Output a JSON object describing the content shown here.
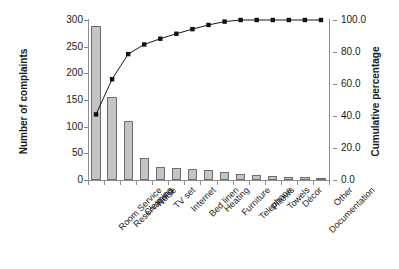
{
  "chart_data": {
    "type": "bar",
    "title": "",
    "subtitle": "",
    "xlabel": "",
    "ylabel": "Number of complaints",
    "y2label": "Cumulative percentage",
    "ylim": [
      0,
      300
    ],
    "y2lim": [
      0,
      100
    ],
    "grid": false,
    "legend": "none",
    "categories": [
      "Room Service",
      "Reservations",
      "Cleaning",
      "Noise",
      "TV set",
      "Internet",
      "Bed linen",
      "Heating",
      "Furniture",
      "Telephone",
      "Pillows",
      "Towels",
      "Décor",
      "Documentation",
      "Other"
    ],
    "series": [
      {
        "name": "Number of complaints",
        "type": "bar",
        "axis": "left",
        "values": [
          288,
          155,
          110,
          42,
          25,
          22,
          20,
          18,
          15,
          12,
          10,
          8,
          6,
          5,
          4
        ]
      },
      {
        "name": "Cumulative percentage",
        "type": "line",
        "axis": "right",
        "values": [
          41.0,
          63.0,
          78.7,
          84.7,
          88.3,
          91.4,
          94.3,
          96.9,
          99.0,
          100.0,
          100.0,
          100.0,
          100.0,
          100.0,
          100.0
        ]
      }
    ],
    "y_ticks": [
      0,
      50,
      100,
      150,
      200,
      250,
      300
    ],
    "y2_ticks": [
      "0.0",
      "20.0",
      "40.0",
      "60.0",
      "80.0",
      "100.0"
    ],
    "colors": {
      "bar_fill": "#c4c4c4",
      "bar_stroke": "#6e6e6e",
      "line": "#1a1a1a",
      "marker": "#111111",
      "axis": "#8f8f8f",
      "text": "#1a1a1a",
      "background": "#ffffff"
    }
  }
}
